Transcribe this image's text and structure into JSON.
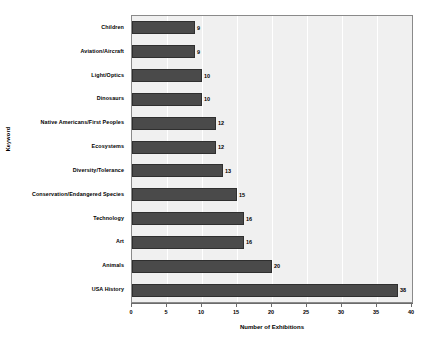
{
  "chart_data": {
    "type": "bar",
    "orientation": "horizontal",
    "title": "",
    "xlabel": "Number of Exhibitions",
    "ylabel": "Keyword",
    "xlim": [
      0,
      40
    ],
    "xticks": [
      0,
      5,
      10,
      15,
      20,
      25,
      30,
      35,
      40
    ],
    "grid": true,
    "legend": false,
    "bar_color": "#4a4a4a",
    "plot_background": "#f0f0f0",
    "categories": [
      "Children",
      "Aviation/Aircraft",
      "Light/Optics",
      "Dinosaurs",
      "Native Americans/First Peoples",
      "Ecosystems",
      "Diversity/Tolerance",
      "Conservation/Endangered Species",
      "Technology",
      "Art",
      "Animals",
      "USA History"
    ],
    "values": [
      9,
      9,
      10,
      10,
      12,
      12,
      13,
      15,
      16,
      16,
      20,
      38
    ],
    "value_labels": [
      "9",
      "9",
      "10",
      "10",
      "12",
      "12",
      "13",
      "15",
      "16",
      "16",
      "20",
      "38"
    ]
  }
}
